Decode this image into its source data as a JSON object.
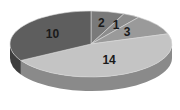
{
  "chart_data": {
    "type": "pie",
    "style": "3d",
    "title": "",
    "categories": [
      "A",
      "B",
      "C",
      "D",
      "E"
    ],
    "values": [
      2,
      1,
      3,
      14,
      10
    ],
    "labels": [
      "2",
      "1",
      "3",
      "14",
      "10"
    ],
    "colors": [
      "#7a7a7a",
      "#8c8c8c",
      "#9a9a9a",
      "#c4c4c4",
      "#5e5e5e"
    ],
    "side_colors": [
      "#5a5a5a",
      "#6a6a6a",
      "#777777",
      "#8a8a8a",
      "#3e3e3e"
    ],
    "start_angle_deg": 0,
    "direction": "clockwise",
    "legend": "none",
    "data_labels": true
  }
}
